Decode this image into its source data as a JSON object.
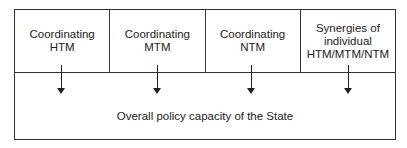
{
  "diagram": {
    "boxes": [
      {
        "line1": "Coordinating",
        "line2": "HTM",
        "line3": ""
      },
      {
        "line1": "Coordinating",
        "line2": "MTM",
        "line3": ""
      },
      {
        "line1": "Coordinating",
        "line2": "NTM",
        "line3": ""
      },
      {
        "line1": "Synergies of",
        "line2": "individual",
        "line3": "HTM/MTM/NTM"
      }
    ],
    "target_label": "Overall policy capacity of the State",
    "arrow_count": 4
  }
}
